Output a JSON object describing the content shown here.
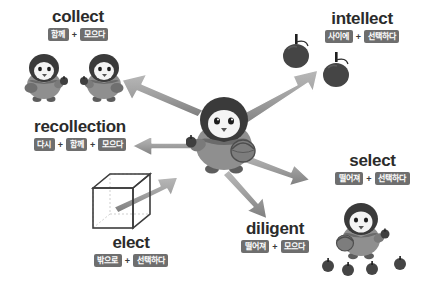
{
  "diagram": {
    "center": {
      "label": "center-penguin",
      "holds": [
        "apple",
        "basket"
      ]
    },
    "colors": {
      "tag_background": "#6e6e6e",
      "tag_text": "#ffffff",
      "headword": "#2b2b2b",
      "arrow_fill": "#9a9a9a",
      "arrow_outline": "#ffffff",
      "background": "#ffffff",
      "penguin_dark": "#3a3a3a",
      "penguin_body": "#8f8f8f",
      "apple": "#4a4a4a"
    },
    "separator": "+",
    "groups": [
      {
        "id": "collect",
        "headword": "collect",
        "parts": [
          "함께",
          "모으다"
        ],
        "illustration": "two-penguins-with-apples"
      },
      {
        "id": "recollection",
        "headword": "recollection",
        "parts": [
          "다시",
          "함께",
          "모으다"
        ],
        "illustration": "none"
      },
      {
        "id": "elect",
        "headword": "elect",
        "parts": [
          "밖으로",
          "선택하다"
        ],
        "illustration": "wireframe-cube-with-arrow"
      },
      {
        "id": "intellect",
        "headword": "intellect",
        "parts": [
          "사이에",
          "선택하다"
        ],
        "illustration": "two-apples"
      },
      {
        "id": "select",
        "headword": "select",
        "parts": [
          "떨어져",
          "선택하다"
        ],
        "illustration": "penguin-with-basket-and-apples"
      },
      {
        "id": "diligent",
        "headword": "diligent",
        "parts": [
          "떨어져",
          "모으다"
        ],
        "illustration": "none"
      }
    ]
  }
}
